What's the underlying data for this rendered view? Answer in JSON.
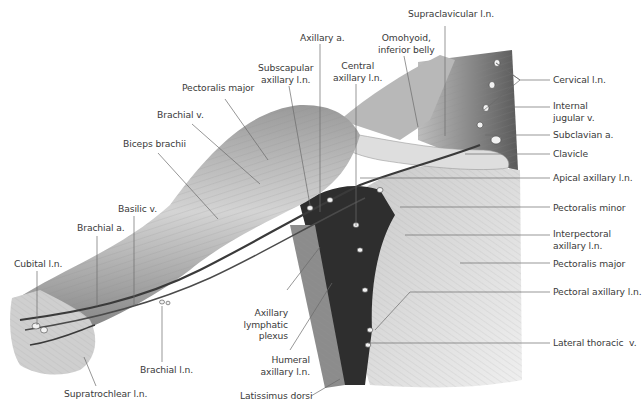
{
  "figure": {
    "background": "#ffffff",
    "label_color": "#3a3a3a",
    "leader_color": "#6a6a6a"
  },
  "labels": [
    {
      "id": "supraclavicular-ln",
      "text": "Supraclavicular l.n.",
      "x": 408,
      "y": 8,
      "align": "left",
      "leader": [
        [
          445,
          26
        ],
        [
          445,
          136
        ]
      ]
    },
    {
      "id": "axillary-a",
      "text": "Axillary a.",
      "x": 300,
      "y": 32,
      "align": "left",
      "leader": [
        [
          320,
          44
        ],
        [
          320,
          212
        ]
      ]
    },
    {
      "id": "omohyoid",
      "text": "Omohyoid,\ninferior belly",
      "x": 378,
      "y": 32,
      "align": "center",
      "leader": [
        [
          404,
          56
        ],
        [
          418,
          127
        ]
      ]
    },
    {
      "id": "subscapular-axillary-ln",
      "text": "Subscapular\naxillary l.n.",
      "x": 258,
      "y": 62,
      "align": "center",
      "leader": [
        [
          289,
          86
        ],
        [
          310,
          205
        ]
      ]
    },
    {
      "id": "central-axillary-ln",
      "text": "Central\naxillary l.n.",
      "x": 333,
      "y": 60,
      "align": "center",
      "leader": [
        [
          356,
          84
        ],
        [
          356,
          226
        ]
      ]
    },
    {
      "id": "pectoralis-major-top",
      "text": "Pectoralis major",
      "x": 182,
      "y": 82,
      "align": "left",
      "leader": [
        [
          225,
          99
        ],
        [
          268,
          160
        ]
      ]
    },
    {
      "id": "brachial-v",
      "text": "Brachial v.",
      "x": 157,
      "y": 109,
      "align": "left",
      "leader": [
        [
          192,
          124
        ],
        [
          260,
          184
        ]
      ]
    },
    {
      "id": "biceps-brachii",
      "text": "Biceps brachii",
      "x": 123,
      "y": 138,
      "align": "left",
      "leader": [
        [
          158,
          153
        ],
        [
          218,
          219
        ]
      ]
    },
    {
      "id": "basilic-v",
      "text": "Basilic v.",
      "x": 118,
      "y": 203,
      "align": "left",
      "leader": [
        [
          134,
          216
        ],
        [
          134,
          306
        ]
      ]
    },
    {
      "id": "brachial-a",
      "text": "Brachial a.",
      "x": 77,
      "y": 222,
      "align": "left",
      "leader": [
        [
          97,
          236
        ],
        [
          97,
          306
        ]
      ]
    },
    {
      "id": "cubital-ln",
      "text": "Cubital l.n.",
      "x": 14,
      "y": 258,
      "align": "left",
      "leader": [
        [
          37,
          271
        ],
        [
          37,
          325
        ]
      ]
    },
    {
      "id": "brachial-ln",
      "text": "Brachial l.n.",
      "x": 140,
      "y": 364,
      "align": "left",
      "leader": [
        [
          162,
          362
        ],
        [
          162,
          306
        ]
      ]
    },
    {
      "id": "supratrochlear-ln",
      "text": "Supratrochlear l.n.",
      "x": 64,
      "y": 388,
      "align": "left",
      "leader": [
        [
          96,
          386
        ],
        [
          84,
          357
        ]
      ]
    },
    {
      "id": "axillary-lymphatic-plexus",
      "text": "Axillary\nlymphatic\nplexus",
      "x": 240,
      "y": 307,
      "align": "right",
      "leader": [
        [
          287,
          290
        ],
        [
          320,
          247
        ]
      ]
    },
    {
      "id": "humeral-axillary-ln",
      "text": "Humeral\naxillary l.n.",
      "x": 262,
      "y": 354,
      "align": "right",
      "leader": [
        [
          290,
          350
        ],
        [
          332,
          283
        ]
      ]
    },
    {
      "id": "latissimus-dorsi",
      "text": "Latissimus dorsi",
      "x": 240,
      "y": 390,
      "align": "left",
      "leader": [
        [
          311,
          396
        ],
        [
          340,
          379
        ]
      ]
    },
    {
      "id": "cervical-ln",
      "text": "Cervical l.n.",
      "x": 553,
      "y": 74,
      "align": "left",
      "leader": [
        [
          550,
          80
        ],
        [
          520,
          80
        ],
        [
          496,
          63
        ],
        [
          520,
          80
        ],
        [
          484,
          110
        ]
      ]
    },
    {
      "id": "internal-jugular-v",
      "text": "Internal\njugular v.",
      "x": 553,
      "y": 100,
      "align": "left",
      "leader": [
        [
          550,
          107
        ],
        [
          505,
          107
        ]
      ]
    },
    {
      "id": "subclavian-a",
      "text": "Subclavian a.",
      "x": 553,
      "y": 129,
      "align": "left",
      "leader": [
        [
          550,
          135
        ],
        [
          485,
          135
        ]
      ]
    },
    {
      "id": "clavicle",
      "text": "Clavicle",
      "x": 553,
      "y": 148,
      "align": "left",
      "leader": [
        [
          550,
          154
        ],
        [
          465,
          154
        ]
      ]
    },
    {
      "id": "apical-axillary-ln",
      "text": "Apical axillary l.n.",
      "x": 553,
      "y": 172,
      "align": "left",
      "leader": [
        [
          550,
          178
        ],
        [
          360,
          178
        ]
      ]
    },
    {
      "id": "pectoralis-minor",
      "text": "Pectoralis minor",
      "x": 553,
      "y": 202,
      "align": "left",
      "leader": [
        [
          550,
          207
        ],
        [
          400,
          207
        ]
      ]
    },
    {
      "id": "interpectoral-axillary-ln",
      "text": "Interpectoral\naxillary l.n.",
      "x": 553,
      "y": 228,
      "align": "left",
      "leader": [
        [
          550,
          235
        ],
        [
          405,
          235
        ]
      ]
    },
    {
      "id": "pectoralis-major-right",
      "text": "Pectoralis major",
      "x": 553,
      "y": 258,
      "align": "left",
      "leader": [
        [
          550,
          263
        ],
        [
          460,
          263
        ]
      ]
    },
    {
      "id": "pectoral-axillary-ln",
      "text": "Pectoral axillary l.n.",
      "x": 553,
      "y": 286,
      "align": "left",
      "leader": [
        [
          550,
          292
        ],
        [
          410,
          292
        ],
        [
          375,
          330
        ]
      ]
    },
    {
      "id": "lateral-thoracic-v",
      "text": "Lateral thoracic  v.",
      "x": 553,
      "y": 337,
      "align": "left",
      "leader": [
        [
          550,
          343
        ],
        [
          368,
          343
        ]
      ]
    }
  ]
}
